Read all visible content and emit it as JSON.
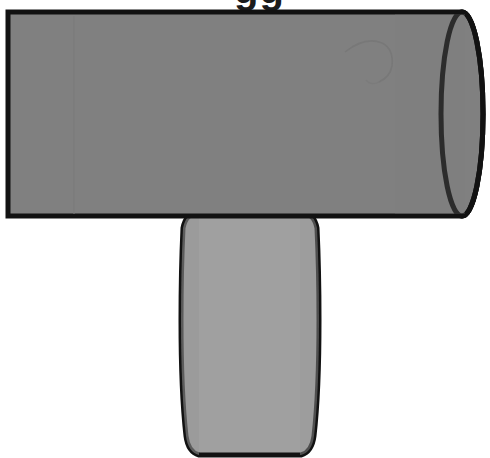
{
  "canvas": {
    "width": 490,
    "height": 458,
    "background_color": "#ffffff",
    "title": "Mallet / cylinder with handle illustration"
  },
  "palette": {
    "outline": "#121212",
    "cylinder_body": "#808080",
    "cylinder_cap": "#6b6b6b",
    "handle_body": "#a0a0a0",
    "background": "#ffffff",
    "scratch": "#757575",
    "seam": "#7a7a7a",
    "glyph": "#1b1b1b"
  },
  "shapes": {
    "cylinder": {
      "name": "Mallet head (horizontal cylinder)",
      "fill_color": "#808080",
      "outline_color": "#121212",
      "outline_width": 5,
      "left_x": 8,
      "right_x": 462,
      "top_y": 12,
      "bottom_y": 216,
      "cap_rx": 21,
      "cap_ry": 102
    },
    "cap": {
      "name": "Cylinder end cap ellipse",
      "fill_color": "#6b6b6b",
      "center_x": 462,
      "center_y": 114,
      "rx": 21,
      "ry": 102
    },
    "handle": {
      "name": "Mallet handle (vertical barrel)",
      "fill_color": "#a0a0a0",
      "outline_color": "#121212",
      "outline_width": 5,
      "top_y": 213,
      "bottom_y": 456,
      "top_left_x": 198,
      "top_right_x": 305,
      "widest_left_x": 181,
      "widest_right_x": 319,
      "bottom_left_x": 192,
      "bottom_right_x": 308,
      "corner_radius": 14
    },
    "scratch": {
      "name": "Faint curved scratch on cylinder surface",
      "color": "#757575"
    },
    "seam": {
      "name": "Faint vertical seam line",
      "color": "#7a7a7a",
      "x": 74,
      "top_y": 16,
      "bottom_y": 214
    }
  },
  "top_text": {
    "value": "gg",
    "note": "partially cropped glyph descenders at top edge",
    "left": 234,
    "top": -31
  }
}
